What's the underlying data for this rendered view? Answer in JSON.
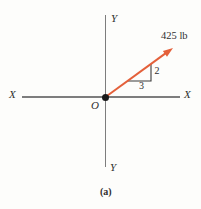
{
  "figure": {
    "caption": "(a)",
    "force_label": "425 lb",
    "origin_label": "O",
    "axis_labels": {
      "x_left": "X",
      "x_right": "X",
      "y_top": "Y",
      "y_bottom": "Y"
    },
    "slope": {
      "rise": "2",
      "run": "3"
    },
    "colors": {
      "vector": "#e4603a",
      "axis": "#7d7d7d",
      "triangle": "#3b3b3b",
      "point": "#1a1a1a",
      "text": "#2f2f2f",
      "background": "#fdfdfb"
    }
  }
}
